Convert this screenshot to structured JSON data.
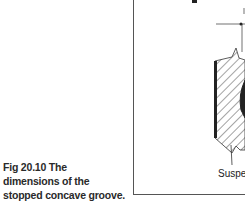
{
  "caption": {
    "text": "Fig 20.10 The dimensions of the stopped concave groove."
  },
  "figure": {
    "label": "Susper",
    "line_color": "#222222",
    "frame_color": "#555555"
  }
}
